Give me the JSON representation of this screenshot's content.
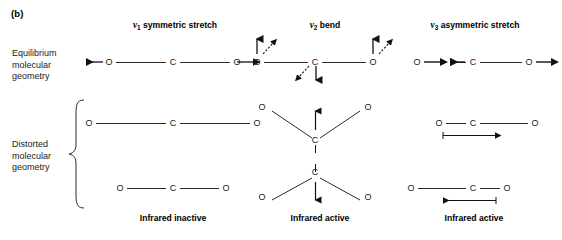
{
  "figure": {
    "panel_label": "(b)",
    "row_labels": {
      "equilibrium": [
        "Equilibrium",
        "molecular",
        "geometry"
      ],
      "distorted": [
        "Distorted",
        "molecular",
        "geometry"
      ]
    },
    "line_color": "#2b2b2b",
    "text_color": "#1a1a1a"
  },
  "modes": [
    {
      "id": "nu1",
      "symbol": "v",
      "subscript": "1",
      "name": "symmetric stretch",
      "activity": "Infrared inactive",
      "atoms": [
        "O",
        "C",
        "O"
      ],
      "equilibrium": {
        "arrows": [
          "left-outward",
          "none",
          "right-outward"
        ],
        "description": "linear O=C=O with outward arrows on both oxygens"
      },
      "distorted": [
        {
          "description": "linear, both bonds stretched long"
        },
        {
          "description": "linear, both bonds compressed short"
        }
      ]
    },
    {
      "id": "nu2",
      "symbol": "v",
      "subscript": "2",
      "name": "bend",
      "activity": "Infrared active",
      "atoms": [
        "O",
        "C",
        "O"
      ],
      "equilibrium": {
        "arrows": [
          "up-and-diagonal",
          "down-and-diagonal",
          "up-and-diagonal"
        ],
        "description": "linear O=C=O with oxygens moving up and carbon moving down"
      },
      "distorted": [
        {
          "description": "bent upward V, carbon at bottom vertex with up arrow"
        },
        {
          "description": "bent downward inverted V, carbon at top vertex with down arrow"
        }
      ]
    },
    {
      "id": "nu3",
      "symbol": "v",
      "subscript": "3",
      "name": "asymmetric stretch",
      "activity": "Infrared active",
      "atoms": [
        "O",
        "C",
        "O"
      ],
      "equilibrium": {
        "arrows": [
          "right",
          "left",
          "right"
        ],
        "description": "linear O=C=O, left oxygen right arrow, carbon left arrow, right oxygen right arrow"
      },
      "distorted": [
        {
          "description": "left bond short, right bond long, displacement arrow pointing right"
        },
        {
          "description": "left bond long, right bond short, displacement arrow pointing left"
        }
      ]
    }
  ]
}
